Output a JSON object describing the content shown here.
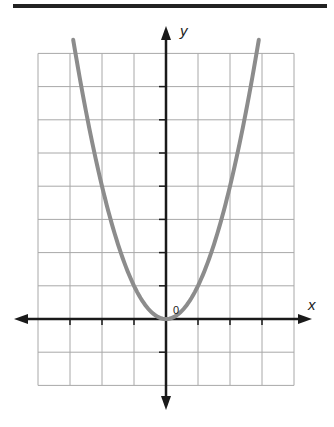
{
  "chart_data": {
    "type": "line",
    "title": "",
    "xlabel": "x",
    "ylabel": "y",
    "origin_label": "0",
    "function": "y = x^2",
    "xlim": [
      -4,
      4
    ],
    "ylim": [
      -2,
      8
    ],
    "grid": true,
    "grid_step": 1,
    "series": [
      {
        "name": "y = x^2",
        "color": "#8c8c8c",
        "x": [
          -2.9,
          -2.5,
          -2,
          -1.5,
          -1,
          -0.5,
          0,
          0.5,
          1,
          1.5,
          2,
          2.5,
          2.9
        ],
        "y": [
          8.41,
          6.25,
          4,
          2.25,
          1,
          0.25,
          0,
          0.25,
          1,
          2.25,
          4,
          6.25,
          8.41
        ]
      }
    ]
  },
  "colors": {
    "grid": "#a8a8a8",
    "axis": "#1a1a1a",
    "curve": "#8c8c8c",
    "topbar": "#222222"
  }
}
